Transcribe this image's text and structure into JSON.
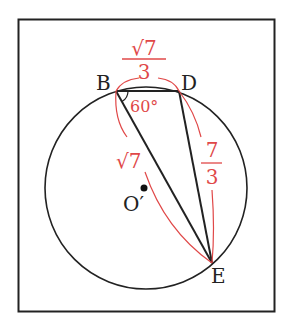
{
  "figure": {
    "points": {
      "B": "B",
      "D": "D",
      "E": "E",
      "center": "O′"
    },
    "angle_label": "60°",
    "side_labels": {
      "BD": {
        "numerator": "√7",
        "denominator": "3"
      },
      "DE": {
        "numerator": "7",
        "denominator": "3"
      },
      "BE": "√7"
    },
    "colors": {
      "line": "#222222",
      "annotation": "#e04848"
    }
  }
}
